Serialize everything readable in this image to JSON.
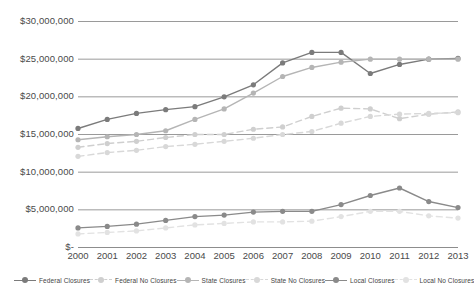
{
  "chart_data": {
    "type": "line",
    "title": "",
    "xlabel": "",
    "ylabel": "",
    "grid": true,
    "legend_position": "bottom",
    "categories": [
      "2000",
      "2001",
      "2002",
      "2003",
      "2004",
      "2005",
      "2006",
      "2007",
      "2008",
      "2009",
      "2010",
      "2011",
      "2012",
      "2013"
    ],
    "ylim": [
      0,
      30000000
    ],
    "ytick_labels": [
      "$30,000,000",
      "$25,000,000",
      "$20,000,000",
      "$15,000,000",
      "$10,000,000",
      "$5,000,000",
      "$-"
    ],
    "ytick_values": [
      30000000,
      25000000,
      20000000,
      15000000,
      10000000,
      5000000,
      0
    ],
    "series": [
      {
        "name": "Federal Closures",
        "color": "#7b7b7b",
        "style": "solid",
        "values": [
          15800000,
          17000000,
          17800000,
          18300000,
          18700000,
          20000000,
          21600000,
          24500000,
          25900000,
          25900000,
          23100000,
          24300000,
          25000000,
          25100000
        ]
      },
      {
        "name": "Federal No Closures",
        "color": "#cfcfcf",
        "style": "dashed",
        "values": [
          13300000,
          13800000,
          14100000,
          14600000,
          15000000,
          15000000,
          15700000,
          16000000,
          17400000,
          18500000,
          18400000,
          17100000,
          17700000,
          18000000
        ]
      },
      {
        "name": "State Closures",
        "color": "#b5b5b5",
        "style": "solid",
        "values": [
          14300000,
          14700000,
          15000000,
          15500000,
          17000000,
          18400000,
          20500000,
          22700000,
          23900000,
          24600000,
          25000000,
          25000000,
          25000000,
          25000000
        ]
      },
      {
        "name": "State No Closures",
        "color": "#d8d8d8",
        "style": "dashed",
        "values": [
          12100000,
          12600000,
          12900000,
          13400000,
          13700000,
          14100000,
          14500000,
          15000000,
          15400000,
          16500000,
          17400000,
          17700000,
          17800000,
          17900000
        ]
      },
      {
        "name": "Local Closures",
        "color": "#8a8a8a",
        "style": "solid",
        "values": [
          2600000,
          2800000,
          3100000,
          3600000,
          4100000,
          4300000,
          4700000,
          4800000,
          4800000,
          5700000,
          6900000,
          7900000,
          6100000,
          5300000
        ]
      },
      {
        "name": "Local No Closures",
        "color": "#e2e2e2",
        "style": "dashed",
        "values": [
          1800000,
          2000000,
          2200000,
          2600000,
          3000000,
          3200000,
          3400000,
          3400000,
          3500000,
          4100000,
          4800000,
          4800000,
          4200000,
          3900000
        ]
      }
    ]
  },
  "axis": {
    "y_labels": [
      "$30,000,000",
      "$25,000,000",
      "$20,000,000",
      "$15,000,000",
      "$10,000,000",
      "$5,000,000",
      "$-"
    ],
    "x_labels": [
      "2000",
      "2001",
      "2002",
      "2003",
      "2004",
      "2005",
      "2006",
      "2007",
      "2008",
      "2009",
      "2010",
      "2011",
      "2012",
      "2013"
    ]
  },
  "legend": {
    "items": [
      {
        "label": "Federal Closures"
      },
      {
        "label": "Federal No Closures"
      },
      {
        "label": "State Closures"
      },
      {
        "label": "State No Closures"
      },
      {
        "label": "Local Closures"
      },
      {
        "label": "Local No Closures"
      }
    ]
  }
}
